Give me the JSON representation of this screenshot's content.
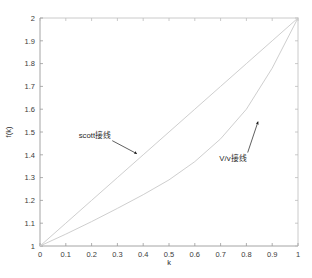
{
  "chart_data": {
    "type": "line",
    "title": "",
    "subtitle": "",
    "xlabel": "k",
    "ylabel": "f(k)",
    "xlim": [
      0,
      1
    ],
    "ylim": [
      1,
      2
    ],
    "grid": false,
    "legend_position": "none",
    "xticks": [
      "0",
      "0.1",
      "0.2",
      "0.3",
      "0.4",
      "0.5",
      "0.6",
      "0.7",
      "0.8",
      "0.9",
      "1"
    ],
    "xtick_values": [
      0,
      0.1,
      0.2,
      0.3,
      0.4,
      0.5,
      0.6,
      0.7,
      0.8,
      0.9,
      1
    ],
    "yticks": [
      "1",
      "1.1",
      "1.2",
      "1.3",
      "1.4",
      "1.5",
      "1.6",
      "1.7",
      "1.8",
      "1.9",
      "2"
    ],
    "ytick_values": [
      1,
      1.1,
      1.2,
      1.3,
      1.4,
      1.5,
      1.6,
      1.7,
      1.8,
      1.9,
      2
    ],
    "x": [
      0,
      0.1,
      0.2,
      0.3,
      0.4,
      0.5,
      0.6,
      0.7,
      0.8,
      0.9,
      1
    ],
    "series": [
      {
        "name": "scott接线",
        "color": "#c8c8c8",
        "values": [
          1.0,
          1.1,
          1.2,
          1.3,
          1.4,
          1.5,
          1.6,
          1.7,
          1.8,
          1.9,
          2.0
        ]
      },
      {
        "name": "V/v接线",
        "color": "#c8c8c8",
        "values": [
          1.0,
          1.052,
          1.107,
          1.165,
          1.225,
          1.29,
          1.37,
          1.47,
          1.6,
          1.78,
          2.0
        ]
      }
    ],
    "annotations": [
      {
        "text": "scott接线",
        "text_x": 0.15,
        "text_y": 1.475,
        "arrow_from_x": 0.28,
        "arrow_from_y": 1.462,
        "arrow_to_x": 0.375,
        "arrow_to_y": 1.405
      },
      {
        "text": "V/v接线",
        "text_x": 0.695,
        "text_y": 1.375,
        "arrow_from_x": 0.805,
        "arrow_from_y": 1.41,
        "arrow_to_x": 0.845,
        "arrow_to_y": 1.545
      }
    ],
    "axis_color": "#b9b9b9",
    "background": "#ffffff"
  }
}
